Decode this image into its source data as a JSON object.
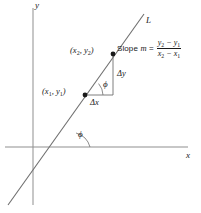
{
  "figure": {
    "type": "diagram",
    "axes": {
      "x_label": "x",
      "y_label": "y"
    },
    "line": {
      "label": "L"
    },
    "points": [
      {
        "name": "point-1",
        "label_x": "x",
        "label_x_sub": "1",
        "label_y": "y",
        "label_y_sub": "1"
      },
      {
        "name": "point-2",
        "label_x": "x",
        "label_x_sub": "2",
        "label_y": "y",
        "label_y_sub": "2"
      }
    ],
    "point_labels": {
      "p1_open": "(",
      "p1_comma": ", ",
      "p1_close": ")",
      "p2_open": "(",
      "p2_comma": ", ",
      "p2_close": ")"
    },
    "deltas": {
      "dx": "Δx",
      "dy": "Δy"
    },
    "angles": {
      "phi_at_axis": "ϕ",
      "phi_at_triangle": "ϕ"
    },
    "slope_formula": {
      "lead": "Slope",
      "symbol": "m",
      "equals": "=",
      "numerator_a": "y",
      "numerator_a_sub": "2",
      "numerator_minus": " − ",
      "numerator_b": "y",
      "numerator_b_sub": "1",
      "denominator_a": "x",
      "denominator_a_sub": "2",
      "denominator_minus": " − ",
      "denominator_b": "x",
      "denominator_b_sub": "1"
    },
    "colors": {
      "ink": "#1a1a1a",
      "axis": "#8a8a8a",
      "line": "#6f6f6f",
      "background": "#ffffff"
    }
  }
}
